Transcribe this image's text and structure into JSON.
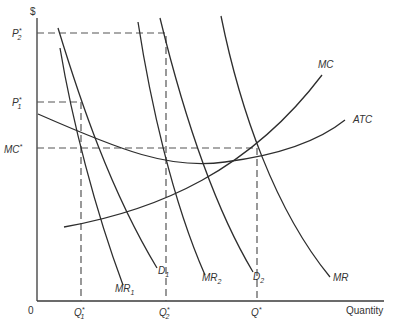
{
  "diagram": {
    "type": "economics-price-discrimination",
    "axes": {
      "y_label": "$",
      "x_label": "Quantity",
      "origin_label": "0"
    },
    "y_ticks": [
      {
        "base": "P",
        "sup": "*",
        "sub": "2"
      },
      {
        "base": "P",
        "sup": "*",
        "sub": "1"
      },
      {
        "base": "MC",
        "sup": "*",
        "sub": ""
      }
    ],
    "x_ticks": [
      {
        "base": "Q",
        "sup": "*",
        "sub": "1"
      },
      {
        "base": "Q",
        "sup": "*",
        "sub": "2"
      },
      {
        "base": "Q",
        "sup": "*",
        "sub": ""
      }
    ],
    "curves": [
      {
        "base": "MR",
        "sub": "1"
      },
      {
        "base": "D",
        "sub": "1"
      },
      {
        "base": "MR",
        "sub": "2"
      },
      {
        "base": "D",
        "sub": "2"
      },
      {
        "base": "MR",
        "sub": ""
      },
      {
        "base": "MC",
        "sub": ""
      },
      {
        "base": "ATC",
        "sub": ""
      }
    ],
    "colors": {
      "line": "#2e2e2e",
      "dashed": "#555555",
      "background": "#ffffff"
    }
  }
}
